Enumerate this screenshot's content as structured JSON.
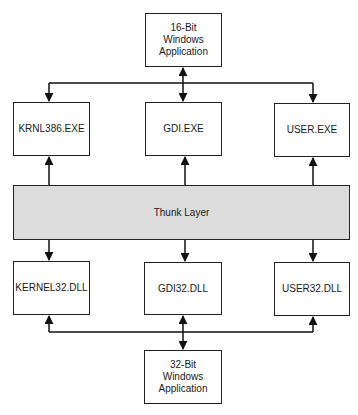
{
  "diagram": {
    "title": "",
    "top_app": {
      "label": "16-Bit\nWindows\nApplication"
    },
    "exe_row": [
      {
        "label": "KRNL386.EXE"
      },
      {
        "label": "GDI.EXE"
      },
      {
        "label": "USER.EXE"
      }
    ],
    "thunk": {
      "label": "Thunk Layer",
      "fill": "#dcdcdc"
    },
    "dll_row": [
      {
        "label": "KERNEL32.DLL"
      },
      {
        "label": "GDI32.DLL"
      },
      {
        "label": "USER32.DLL"
      }
    ],
    "bottom_app": {
      "label": "32-Bit\nWindows\nApplication"
    },
    "connections": [
      {
        "from": "16-Bit Windows Application",
        "to": "KRNL386.EXE",
        "direction": "down"
      },
      {
        "from": "16-Bit Windows Application",
        "to": "GDI.EXE",
        "direction": "bidirectional"
      },
      {
        "from": "16-Bit Windows Application",
        "to": "USER.EXE",
        "direction": "down"
      },
      {
        "from": "Thunk Layer",
        "to": "KRNL386.EXE",
        "direction": "up"
      },
      {
        "from": "Thunk Layer",
        "to": "GDI.EXE",
        "direction": "up"
      },
      {
        "from": "Thunk Layer",
        "to": "USER.EXE",
        "direction": "up"
      },
      {
        "from": "Thunk Layer",
        "to": "KERNEL32.DLL",
        "direction": "down"
      },
      {
        "from": "Thunk Layer",
        "to": "GDI32.DLL",
        "direction": "down"
      },
      {
        "from": "Thunk Layer",
        "to": "USER32.DLL",
        "direction": "down"
      },
      {
        "from": "32-Bit Windows Application",
        "to": "KERNEL32.DLL",
        "direction": "up"
      },
      {
        "from": "32-Bit Windows Application",
        "to": "GDI32.DLL",
        "direction": "bidirectional"
      },
      {
        "from": "32-Bit Windows Application",
        "to": "USER32.DLL",
        "direction": "up"
      }
    ]
  }
}
